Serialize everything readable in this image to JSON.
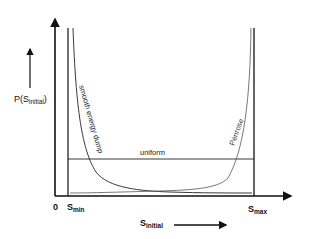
{
  "diagram": {
    "y_axis_label": {
      "main": "P(S",
      "sub": "initial",
      "close": ")"
    },
    "x_axis_label": {
      "main": "S",
      "sub": "initial"
    },
    "origin_label": "0",
    "s_min_label": {
      "main": "S",
      "sub": "min"
    },
    "s_max_label": {
      "main": "S",
      "sub": "max"
    },
    "curves": [
      {
        "name": "smooth energy dump",
        "label": "smooth energy dump"
      },
      {
        "name": "Penrose",
        "label": "Penrose"
      },
      {
        "name": "uniform",
        "label": "uniform"
      }
    ],
    "colors": {
      "axis": "#111111",
      "curve": "#222222",
      "penrose": "#555555",
      "background": "#ffffff"
    }
  }
}
